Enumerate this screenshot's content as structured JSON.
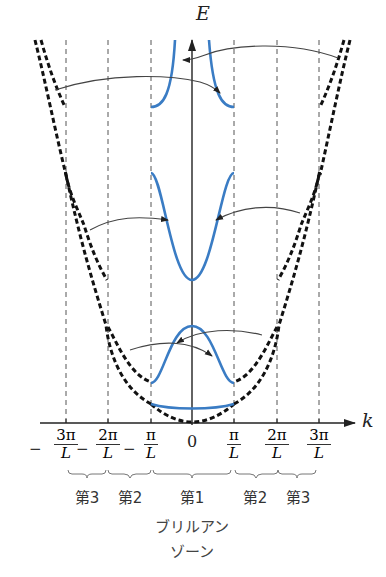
{
  "figure": {
    "title_lines": [
      "ブリルアン",
      "ゾーン"
    ],
    "axes": {
      "y_label": "E",
      "x_label": "k",
      "origin_label": "0"
    },
    "ticks": [
      {
        "id": "neg3",
        "sign": "−",
        "num": "3π",
        "den": "L",
        "x": 66
      },
      {
        "id": "neg2",
        "sign": "−",
        "num": "2π",
        "den": "L",
        "x": 108
      },
      {
        "id": "neg1",
        "sign": "−",
        "num": "π",
        "den": "L",
        "x": 151
      },
      {
        "id": "pos1",
        "sign": "",
        "num": "π",
        "den": "L",
        "x": 234
      },
      {
        "id": "pos2",
        "sign": "",
        "num": "2π",
        "den": "L",
        "x": 277
      },
      {
        "id": "pos3",
        "sign": "",
        "num": "3π",
        "den": "L",
        "x": 319
      }
    ],
    "zones": [
      {
        "label": "第3",
        "x": 87
      },
      {
        "label": "第2",
        "x": 130
      },
      {
        "label": "第1",
        "x": 192
      },
      {
        "label": "第2",
        "x": 255
      },
      {
        "label": "第3",
        "x": 298
      }
    ],
    "colors": {
      "band_reduced": "#3a7cc4",
      "band_extended": "#111111",
      "axis": "#222222",
      "zone_boundary": "#555555",
      "arrow": "#444444"
    },
    "legend": {
      "reduced_zone_bands": "blue solid curves (reduced zone scheme)",
      "extended_zone_bands": "black dashed curves (free-electron / extended zone)"
    }
  }
}
